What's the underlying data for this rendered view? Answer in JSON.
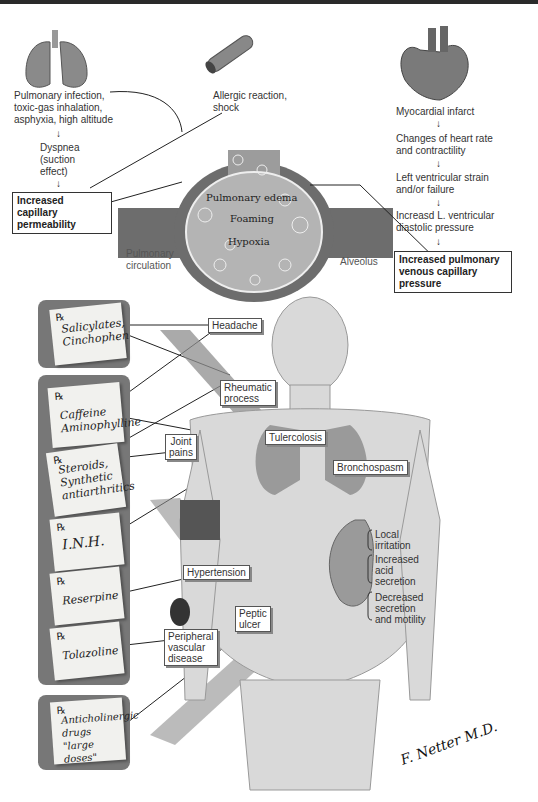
{
  "top_section": {
    "lung_causes": "Pulmonary infection, toxic-gas inhalation, asphyxia, high altitude",
    "lung_causes_lines": [
      "Pulmonary infection,",
      "toxic-gas inhalation,",
      "asphyxia, high altitude"
    ],
    "dyspnea_lines": [
      "Dyspnea",
      "(suction",
      "effect)"
    ],
    "allergic_lines": [
      "Allergic reaction,",
      "shock"
    ],
    "capillary_permeability_lines": [
      "Increased capillary",
      "permeability"
    ],
    "heart_chain": [
      [
        "Myocardial infarct"
      ],
      [
        "Changes of heart rate",
        "and contractility"
      ],
      [
        "Left ventricular strain",
        "and/or failure"
      ],
      [
        "Increasd L. ventricular",
        "diastolic pressure"
      ]
    ],
    "venous_pressure_lines": [
      "Increased pulmonary",
      "venous capillary pressure"
    ],
    "alveolus_inner": [
      "Pulmonary edema",
      "Foaming",
      "Hypoxia"
    ],
    "pulmonary_circulation_lines": [
      "Pulmonary",
      "circulation"
    ],
    "alveolus_label": "Alveolus",
    "arrow_glyph": "↓"
  },
  "prescriptions": {
    "rx_symbol": "℞",
    "items": [
      {
        "lines": [
          "Salicylates,",
          "Cinchophen"
        ]
      },
      {
        "lines": [
          "Caffeine",
          "Aminophylline"
        ]
      },
      {
        "lines": [
          "Steroids,",
          "Synthetic",
          "antiarthritics"
        ]
      },
      {
        "lines": [
          "I.N.H."
        ]
      },
      {
        "lines": [
          "Reserpine"
        ]
      },
      {
        "lines": [
          "Tolazoline"
        ]
      },
      {
        "lines": [
          "Anticholinergic",
          "drugs",
          "\"large doses\""
        ]
      }
    ]
  },
  "conditions": {
    "headache": "Headache",
    "rheumatic_lines": [
      "Rheumatic",
      "process"
    ],
    "joint_pains_lines": [
      "Joint",
      "pains"
    ],
    "tuberculosis": "Tulercolosis",
    "bronchospasm": "Bronchospasm",
    "hypertension": "Hypertension",
    "peptic_ulcer_lines": [
      "Peptic",
      "ulcer"
    ],
    "peripheral_lines": [
      "Peripheral",
      "vascular",
      "disease"
    ],
    "stomach_effects": [
      [
        "Local",
        "irritation"
      ],
      [
        "Increased",
        "acid",
        "secretion"
      ],
      [
        "Decreased",
        "secretion",
        "and motility"
      ]
    ]
  },
  "signature": "F. Netter M.D."
}
